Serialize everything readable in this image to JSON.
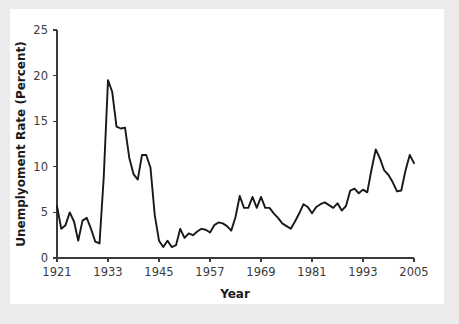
{
  "figure": {
    "background_color": "#ffffff",
    "page_background_color": "#ebebeb",
    "line_color": "#181818",
    "axis_color": "#3a3a3a"
  },
  "chart_data": {
    "type": "line",
    "title": "",
    "xlabel": "Year",
    "ylabel": "Unemplyoment Rate (Percent)",
    "xlim": [
      1921,
      2005
    ],
    "ylim": [
      0,
      25
    ],
    "xticks": [
      1921,
      1933,
      1945,
      1957,
      1969,
      1981,
      1993,
      2005
    ],
    "yticks": [
      0,
      5,
      10,
      15,
      20,
      25
    ],
    "grid": false,
    "legend": "none",
    "series": [
      {
        "name": "Unemployment Rate",
        "x": [
          1921,
          1922,
          1923,
          1924,
          1925,
          1926,
          1927,
          1928,
          1929,
          1930,
          1931,
          1932,
          1933,
          1934,
          1935,
          1936,
          1937,
          1938,
          1939,
          1940,
          1941,
          1942,
          1943,
          1944,
          1945,
          1946,
          1947,
          1948,
          1949,
          1950,
          1951,
          1952,
          1953,
          1954,
          1955,
          1956,
          1957,
          1958,
          1959,
          1960,
          1961,
          1962,
          1963,
          1964,
          1965,
          1966,
          1967,
          1968,
          1969,
          1970,
          1971,
          1972,
          1973,
          1974,
          1975,
          1976,
          1977,
          1978,
          1979,
          1980,
          1981,
          1982,
          1983,
          1984,
          1985,
          1986,
          1987,
          1988,
          1989,
          1990,
          1991,
          1992,
          1993,
          1994,
          1995,
          1996,
          1997,
          1998,
          1999,
          2000,
          2001,
          2002,
          2003,
          2004,
          2005
        ],
        "values": [
          5.7,
          3.2,
          3.6,
          5.0,
          4.0,
          1.9,
          4.1,
          4.4,
          3.2,
          1.8,
          1.6,
          8.9,
          19.5,
          18.2,
          14.4,
          14.2,
          14.3,
          11.0,
          9.2,
          8.6,
          11.3,
          11.3,
          9.9,
          4.7,
          1.9,
          1.2,
          1.9,
          1.2,
          1.4,
          3.2,
          2.2,
          2.7,
          2.5,
          2.9,
          3.2,
          3.1,
          2.8,
          3.6,
          3.9,
          3.8,
          3.5,
          3.0,
          4.5,
          6.8,
          5.5,
          5.5,
          6.7,
          5.5,
          6.7,
          5.5,
          5.5,
          4.9,
          4.4,
          3.8,
          3.5,
          3.2,
          4.0,
          4.9,
          5.9,
          5.6,
          4.9,
          5.6,
          5.9,
          6.1,
          5.8,
          5.5,
          6.0,
          5.2,
          5.7,
          7.4,
          7.6,
          7.1,
          7.5,
          7.2,
          9.7,
          11.9,
          10.9,
          9.6,
          9.1,
          8.3,
          7.3,
          7.4,
          9.6,
          11.3,
          10.4
        ]
      }
    ]
  },
  "axis": {
    "x_title": "Year",
    "y_title": "Unemplyoment Rate (Percent)"
  }
}
